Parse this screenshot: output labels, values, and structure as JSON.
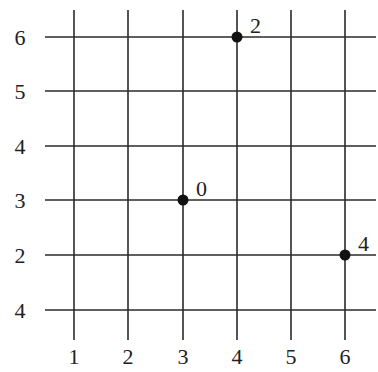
{
  "chart_data": {
    "type": "scatter",
    "title": "",
    "xlabel": "",
    "ylabel": "",
    "grid": true,
    "x_tick_labels": [
      "1",
      "2",
      "3",
      "4",
      "5",
      "6"
    ],
    "y_tick_labels_top_to_bottom": [
      "6",
      "5",
      "4",
      "3",
      "2",
      "4"
    ],
    "points": [
      {
        "x": 4,
        "y": 6,
        "label": "2"
      },
      {
        "x": 3,
        "y": 3,
        "label": "0"
      },
      {
        "x": 6,
        "y": 2,
        "label": "4"
      }
    ],
    "colors": {
      "grid": "#2a2a2a",
      "point": "#111111",
      "text": "#222222"
    }
  }
}
